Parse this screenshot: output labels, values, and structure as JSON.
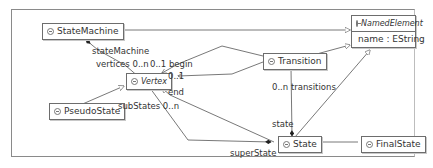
{
  "diagram": {
    "classes": {
      "state_machine": {
        "name": "StateMachine"
      },
      "named_element": {
        "name": "NamedElement",
        "abstract": true,
        "attribute": "name : EString"
      },
      "transition": {
        "name": "Transition"
      },
      "vertex": {
        "name": "Vertex",
        "abstract": true
      },
      "pseudo_state": {
        "name": "PseudoState"
      },
      "state": {
        "name": "State"
      },
      "final_state": {
        "name": "FinalState"
      }
    },
    "labels": {
      "state_machine_role": "stateMachine",
      "vertices": "vertices 0..n",
      "begin": "0..1 begin",
      "begin_target": "0..1",
      "end": "end",
      "sub_states": "subStates 0..n",
      "transitions": "0..n transitions",
      "state_role": "state",
      "super_state": "superState"
    },
    "colors": {
      "line": "#555555",
      "box_border": "#6d6d6d",
      "background": "#ffffff"
    }
  }
}
